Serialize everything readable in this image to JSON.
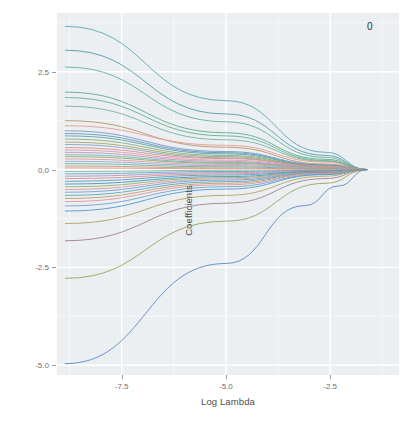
{
  "figure": {
    "width": 415,
    "height": 421,
    "background": "#ffffff",
    "panel_background": "#ebeff1",
    "gridline_color": "#ffffff",
    "tick_color": "#6e6e6e",
    "axis_title_color": "#4d4d4d"
  },
  "axes": {
    "x_title": "Log Lambda",
    "y_title": "Coefficients",
    "x_ticks": [
      "-7.5",
      "-5.0",
      "-2.5"
    ],
    "y_ticks": [
      "2.5",
      "0.0",
      "-2.5",
      "-5.0"
    ]
  },
  "annotations": {
    "top_nonzero_count": "0"
  },
  "chart_data": {
    "type": "line",
    "title": "",
    "subtitle": "",
    "xlabel": "Log Lambda",
    "ylabel": "Coefficients",
    "xlim": [
      -9.05,
      -0.85
    ],
    "ylim": [
      -5.25,
      4.0
    ],
    "xticks": [
      -7.5,
      -5.0,
      -2.5
    ],
    "yticks": [
      2.5,
      0.0,
      -2.5,
      -5.0
    ],
    "grid": true,
    "minor_grid": true,
    "legend": "none",
    "legend_position": "none",
    "annotations": [
      {
        "text": "0",
        "x": -1.55,
        "y": 3.66,
        "note": "number of non-zero coefficients shown at top of panel"
      }
    ],
    "converge_x": -1.62,
    "series": [
      {
        "name": "v1",
        "color": "#59a6b7",
        "values": [
          [
            -8.85,
            3.66
          ],
          [
            -5.0,
            1.76
          ],
          [
            -2.6,
            0.44
          ],
          [
            -1.62,
            0.0
          ]
        ]
      },
      {
        "name": "v2",
        "color": "#4f9aa8",
        "values": [
          [
            -8.85,
            3.05
          ],
          [
            -5.0,
            1.42
          ],
          [
            -2.6,
            0.36
          ],
          [
            -1.62,
            0.0
          ]
        ]
      },
      {
        "name": "v3",
        "color": "#63ad9a",
        "values": [
          [
            -8.85,
            2.62
          ],
          [
            -5.0,
            1.22
          ],
          [
            -2.6,
            0.31
          ],
          [
            -1.62,
            0.0
          ]
        ]
      },
      {
        "name": "v4",
        "color": "#5fa98c",
        "values": [
          [
            -8.85,
            1.98
          ],
          [
            -5.0,
            0.94
          ],
          [
            -2.6,
            0.26
          ],
          [
            -1.62,
            0.0
          ]
        ]
      },
      {
        "name": "v5",
        "color": "#63ae8d",
        "values": [
          [
            -8.85,
            1.84
          ],
          [
            -5.0,
            0.86
          ],
          [
            -2.6,
            0.23
          ],
          [
            -1.62,
            0.0
          ]
        ]
      },
      {
        "name": "v6",
        "color": "#74b09b",
        "values": [
          [
            -8.85,
            1.62
          ],
          [
            -5.0,
            0.76
          ],
          [
            -2.6,
            0.21
          ],
          [
            -1.62,
            0.0
          ]
        ]
      },
      {
        "name": "v7",
        "color": "#b59463",
        "values": [
          [
            -8.85,
            1.25
          ],
          [
            -5.0,
            0.57
          ],
          [
            -2.6,
            0.14
          ],
          [
            -1.62,
            0.0
          ]
        ]
      },
      {
        "name": "v8",
        "color": "#e59a94",
        "values": [
          [
            -8.85,
            1.12
          ],
          [
            -5.0,
            0.62
          ],
          [
            -2.6,
            0.19
          ],
          [
            -1.62,
            0.0
          ]
        ]
      },
      {
        "name": "v9",
        "color": "#7e93c7",
        "values": [
          [
            -8.85,
            0.99
          ],
          [
            -5.0,
            0.46
          ],
          [
            -2.6,
            0.12
          ],
          [
            -1.62,
            0.0
          ]
        ]
      },
      {
        "name": "v10",
        "color": "#5e95b5",
        "values": [
          [
            -8.85,
            0.92
          ],
          [
            -5.0,
            0.43
          ],
          [
            -2.6,
            0.11
          ],
          [
            -1.62,
            0.0
          ]
        ]
      },
      {
        "name": "v11",
        "color": "#56a0ab",
        "values": [
          [
            -8.85,
            0.86
          ],
          [
            -5.0,
            0.4
          ],
          [
            -2.6,
            0.1
          ],
          [
            -1.62,
            0.0
          ]
        ]
      },
      {
        "name": "v12",
        "color": "#7fb07c",
        "values": [
          [
            -8.85,
            0.78
          ],
          [
            -5.0,
            0.36
          ],
          [
            -2.6,
            0.09
          ],
          [
            -1.62,
            0.0
          ]
        ]
      },
      {
        "name": "v13",
        "color": "#a8a25f",
        "values": [
          [
            -8.85,
            0.7
          ],
          [
            -5.0,
            0.33
          ],
          [
            -2.6,
            0.09
          ],
          [
            -1.62,
            0.0
          ]
        ]
      },
      {
        "name": "v14",
        "color": "#7fa6c0",
        "values": [
          [
            -8.85,
            0.64
          ],
          [
            -5.0,
            0.3
          ],
          [
            -2.6,
            0.08
          ],
          [
            -1.62,
            0.0
          ]
        ]
      },
      {
        "name": "v15",
        "color": "#e0888f",
        "values": [
          [
            -8.85,
            0.56
          ],
          [
            -5.0,
            0.28
          ],
          [
            -2.6,
            0.08
          ],
          [
            -1.62,
            0.0
          ]
        ]
      },
      {
        "name": "v16",
        "color": "#d79a9f",
        "values": [
          [
            -8.85,
            0.5
          ],
          [
            -5.0,
            0.24
          ],
          [
            -2.6,
            0.07
          ],
          [
            -1.62,
            0.0
          ]
        ]
      },
      {
        "name": "v17",
        "color": "#c08fc0",
        "values": [
          [
            -8.85,
            0.44
          ],
          [
            -5.0,
            0.21
          ],
          [
            -2.6,
            0.06
          ],
          [
            -1.62,
            0.0
          ]
        ]
      },
      {
        "name": "v18",
        "color": "#6fb5b5",
        "values": [
          [
            -8.85,
            0.38
          ],
          [
            -5.0,
            0.18
          ],
          [
            -2.6,
            0.05
          ],
          [
            -1.62,
            0.0
          ]
        ]
      },
      {
        "name": "v19",
        "color": "#86ad6a",
        "values": [
          [
            -8.85,
            0.33
          ],
          [
            -5.0,
            0.16
          ],
          [
            -2.6,
            0.05
          ],
          [
            -1.62,
            0.0
          ]
        ]
      },
      {
        "name": "v20",
        "color": "#e9949c",
        "values": [
          [
            -8.85,
            0.27
          ],
          [
            -5.0,
            0.13
          ],
          [
            -2.6,
            0.04
          ],
          [
            -1.62,
            0.0
          ]
        ]
      },
      {
        "name": "v21",
        "color": "#8fa7d0",
        "values": [
          [
            -8.85,
            0.21
          ],
          [
            -5.0,
            0.1
          ],
          [
            -2.6,
            0.03
          ],
          [
            -1.62,
            0.0
          ]
        ]
      },
      {
        "name": "v22",
        "color": "#64b0a8",
        "values": [
          [
            -8.85,
            0.15
          ],
          [
            -5.0,
            0.07
          ],
          [
            -2.6,
            0.02
          ],
          [
            -1.62,
            0.0
          ]
        ]
      },
      {
        "name": "v23",
        "color": "#c59a5e",
        "values": [
          [
            -8.85,
            0.09
          ],
          [
            -5.0,
            0.04
          ],
          [
            -2.6,
            0.01
          ],
          [
            -1.62,
            0.0
          ]
        ]
      },
      {
        "name": "v24",
        "color": "#e58f98",
        "values": [
          [
            -8.85,
            0.04
          ],
          [
            -5.0,
            0.02
          ],
          [
            -2.6,
            0.01
          ],
          [
            -1.62,
            0.0
          ]
        ]
      },
      {
        "name": "v25",
        "color": "#7fbf9a",
        "values": [
          [
            -8.85,
            -0.05
          ],
          [
            -5.0,
            -0.02
          ],
          [
            -2.6,
            -0.01
          ],
          [
            -1.62,
            0.0
          ]
        ]
      },
      {
        "name": "v26",
        "color": "#5aa9c4",
        "values": [
          [
            -8.85,
            -0.11
          ],
          [
            -5.0,
            -0.05
          ],
          [
            -2.6,
            -0.02
          ],
          [
            -1.62,
            0.0
          ]
        ]
      },
      {
        "name": "v27",
        "color": "#b08fc7",
        "values": [
          [
            -8.85,
            -0.17
          ],
          [
            -5.0,
            -0.08
          ],
          [
            -2.6,
            -0.02
          ],
          [
            -1.62,
            0.0
          ]
        ]
      },
      {
        "name": "v28",
        "color": "#dd8a92",
        "values": [
          [
            -8.85,
            -0.23
          ],
          [
            -5.0,
            -0.11
          ],
          [
            -2.6,
            -0.03
          ],
          [
            -1.62,
            0.0
          ]
        ]
      },
      {
        "name": "v29",
        "color": "#4f9fb0",
        "values": [
          [
            -8.85,
            -0.3
          ],
          [
            -5.0,
            -0.14
          ],
          [
            -2.6,
            -0.04
          ],
          [
            -1.62,
            0.0
          ]
        ]
      },
      {
        "name": "v30",
        "color": "#3f8fc7",
        "values": [
          [
            -8.85,
            -0.37
          ],
          [
            -5.0,
            -0.18
          ],
          [
            -2.6,
            -0.05
          ],
          [
            -1.62,
            0.0
          ]
        ]
      },
      {
        "name": "v31",
        "color": "#8fb067",
        "values": [
          [
            -8.85,
            -0.44
          ],
          [
            -5.0,
            -0.21
          ],
          [
            -2.6,
            -0.06
          ],
          [
            -1.62,
            0.0
          ]
        ]
      },
      {
        "name": "v32",
        "color": "#e4959c",
        "values": [
          [
            -8.85,
            -0.51
          ],
          [
            -5.0,
            -0.24
          ],
          [
            -2.6,
            -0.07
          ],
          [
            -1.62,
            0.0
          ]
        ]
      },
      {
        "name": "v33",
        "color": "#6f9fd0",
        "values": [
          [
            -8.85,
            -0.58
          ],
          [
            -5.0,
            -0.27
          ],
          [
            -2.6,
            -0.07
          ],
          [
            -1.62,
            0.0
          ]
        ]
      },
      {
        "name": "v34",
        "color": "#55a5b8",
        "values": [
          [
            -8.85,
            -0.66
          ],
          [
            -5.0,
            -0.31
          ],
          [
            -2.6,
            -0.08
          ],
          [
            -1.62,
            0.0
          ]
        ]
      },
      {
        "name": "v35",
        "color": "#c39a68",
        "values": [
          [
            -8.85,
            -0.74
          ],
          [
            -5.0,
            -0.35
          ],
          [
            -2.6,
            -0.09
          ],
          [
            -1.62,
            0.0
          ]
        ]
      },
      {
        "name": "v36",
        "color": "#e0909a",
        "values": [
          [
            -8.85,
            -0.82
          ],
          [
            -5.0,
            -0.39
          ],
          [
            -2.6,
            -0.1
          ],
          [
            -1.62,
            0.0
          ]
        ]
      },
      {
        "name": "v37",
        "color": "#6aa0cc",
        "values": [
          [
            -8.85,
            -0.93
          ],
          [
            -5.0,
            -0.44
          ],
          [
            -2.6,
            -0.12
          ],
          [
            -1.62,
            0.0
          ]
        ]
      },
      {
        "name": "v38",
        "color": "#4f96c9",
        "values": [
          [
            -8.85,
            -1.06
          ],
          [
            -5.0,
            -0.5
          ],
          [
            -2.6,
            -0.13
          ],
          [
            -1.62,
            0.0
          ]
        ]
      },
      {
        "name": "v39",
        "color": "#b0a05e",
        "values": [
          [
            -8.85,
            -1.38
          ],
          [
            -5.0,
            -0.66
          ],
          [
            -2.6,
            -0.17
          ],
          [
            -1.62,
            0.0
          ]
        ]
      },
      {
        "name": "v40",
        "color": "#9a7f8f",
        "values": [
          [
            -8.85,
            -1.82
          ],
          [
            -5.0,
            -0.86
          ],
          [
            -2.6,
            -0.23
          ],
          [
            -1.62,
            0.0
          ]
        ]
      },
      {
        "name": "v41",
        "color": "#98a05e",
        "values": [
          [
            -8.85,
            -2.78
          ],
          [
            -5.0,
            -1.32
          ],
          [
            -2.6,
            -0.35
          ],
          [
            -1.62,
            0.0
          ]
        ]
      },
      {
        "name": "v42",
        "color": "#5b86c8",
        "values": [
          [
            -8.85,
            -4.96
          ],
          [
            -5.0,
            -2.4
          ],
          [
            -3.1,
            -0.92
          ],
          [
            -2.3,
            -0.42
          ],
          [
            -1.62,
            0.0
          ]
        ]
      }
    ]
  }
}
